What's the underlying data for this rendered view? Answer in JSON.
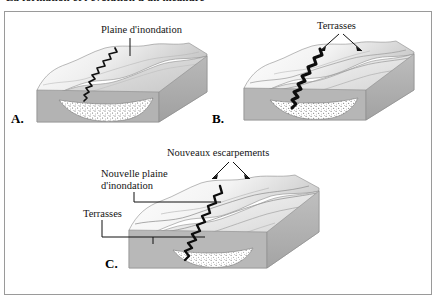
{
  "page": {
    "heading_cutoff": "La formation et l'évolution d'un méandre",
    "background": "#ffffff",
    "frame_border_color": "#9a9a9a"
  },
  "figure": {
    "panels": [
      {
        "id": "A",
        "letter": "A.",
        "labels": [
          {
            "name": "plaine-inondation",
            "text": "Plaine d'inondation"
          }
        ]
      },
      {
        "id": "B",
        "letter": "B.",
        "labels": [
          {
            "name": "terrasses",
            "text": "Terrasses"
          }
        ]
      },
      {
        "id": "C",
        "letter": "C.",
        "labels": [
          {
            "name": "nouveaux-escarpements",
            "text": "Nouveaux escarpements"
          },
          {
            "name": "nouvelle-plaine-inondation-l1",
            "text": "Nouvelle plaine"
          },
          {
            "name": "nouvelle-plaine-inondation-l2",
            "text": "d'inondation"
          },
          {
            "name": "terrasses",
            "text": "Terrasses"
          }
        ]
      }
    ]
  },
  "colors": {
    "surface_light": "#f2f2f2",
    "surface_mid": "#cfcfcf",
    "surface_dark": "#a8a8a8",
    "block_side": "#9e9e9e",
    "block_front": "#b4b4b4",
    "river": "#111111",
    "alluvium_fill": "#ffffff",
    "stipple": "#4a4a4a",
    "outline": "#6d6d6d",
    "text": "#141414"
  }
}
